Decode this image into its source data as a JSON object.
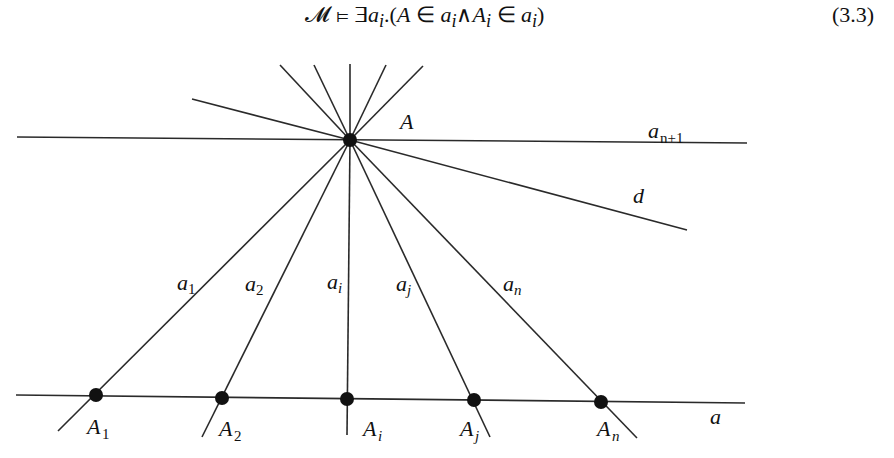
{
  "equation": {
    "lhs": "𝓜",
    "models": "⊨",
    "body_prefix": "∃",
    "var": "a",
    "var_sub": "i",
    "dot_open": ".(",
    "A": "A",
    "in1": " ∈ ",
    "a1": "a",
    "a1_sub": "i",
    "and": "∧",
    "Ai": "A",
    "Ai_sub": "i",
    "in2": " ∈ ",
    "a2": "a",
    "a2_sub": "i",
    "close": ")",
    "number": "(3.3)"
  },
  "diagram": {
    "center_point": {
      "label": "A",
      "x": 350,
      "y": 140
    },
    "lines": {
      "a_n_plus_1": {
        "label": "a",
        "sub": "n+1"
      },
      "d": {
        "label": "d"
      },
      "a": {
        "label": "a"
      }
    },
    "rays": [
      {
        "label": "a",
        "sub": "1"
      },
      {
        "label": "a",
        "sub": "2"
      },
      {
        "label": "a",
        "sub": "i"
      },
      {
        "label": "a",
        "sub": "j"
      },
      {
        "label": "a",
        "sub": "n"
      }
    ],
    "points": [
      {
        "label": "A",
        "sub": "1"
      },
      {
        "label": "A",
        "sub": "2"
      },
      {
        "label": "A",
        "sub": "i"
      },
      {
        "label": "A",
        "sub": "j"
      },
      {
        "label": "A",
        "sub": "n"
      }
    ]
  }
}
